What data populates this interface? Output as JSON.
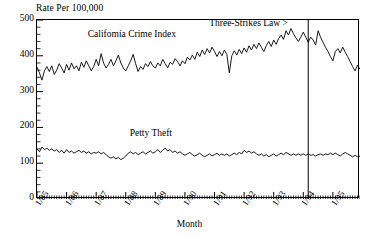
{
  "chart_data": {
    "type": "line",
    "title": "",
    "ylabel": "Rate Per 100,000",
    "xlabel": "Month",
    "ylim": [
      0,
      500
    ],
    "yticks": [
      0,
      100,
      200,
      300,
      400,
      500
    ],
    "ytick_labels": [
      "0",
      "100",
      "200",
      "300",
      "400",
      "500"
    ],
    "xtick_labels": [
      "1/85",
      "1/86",
      "1/87",
      "1/88",
      "1/89",
      "1/90",
      "1/91",
      "1/92",
      "1/93",
      "1/94",
      "1/95"
    ],
    "xlim_months": [
      0,
      131
    ],
    "grid": false,
    "legend": "inline-labels",
    "annotations": [
      {
        "name": "three-strikes-law",
        "text": "Three-Strikes Law >",
        "x_month": 110,
        "y_value": 492
      },
      {
        "name": "vline-three-strikes",
        "type": "vline",
        "x_month": 110,
        "label": "Three-Strikes Law enactment (3/94)"
      }
    ],
    "series": [
      {
        "name": "California Crime Index",
        "label": "Califomia Crime Index",
        "label_x_month": 21,
        "label_y_value": 455,
        "color": "#000000",
        "values": [
          368,
          352,
          332,
          358,
          370,
          356,
          372,
          348,
          360,
          378,
          366,
          352,
          376,
          360,
          380,
          364,
          372,
          358,
          382,
          368,
          386,
          372,
          358,
          370,
          390,
          372,
          406,
          380,
          366,
          376,
          390,
          372,
          386,
          402,
          380,
          366,
          358,
          372,
          386,
          404,
          378,
          356,
          370,
          362,
          378,
          370,
          384,
          372,
          366,
          380,
          372,
          390,
          378,
          366,
          382,
          376,
          392,
          384,
          372,
          386,
          378,
          396,
          388,
          402,
          390,
          410,
          398,
          416,
          404,
          420,
          408,
          424,
          412,
          398,
          412,
          400,
          416,
          404,
          352,
          400,
          414,
          402,
          418,
          406,
          422,
          410,
          428,
          416,
          432,
          420,
          436,
          424,
          412,
          428,
          440,
          426,
          444,
          432,
          448,
          458,
          446,
          470,
          458,
          476,
          462,
          450,
          440,
          452,
          466,
          452,
          438,
          452,
          444,
          430,
          470,
          452,
          438,
          424,
          412,
          398,
          386,
          412,
          420,
          408,
          424,
          410,
          398,
          384,
          370,
          358,
          374,
          362
        ]
      },
      {
        "name": "Petty Theft",
        "label": "Petty Theft",
        "label_x_month": 38,
        "label_y_value": 178,
        "color": "#000000",
        "values": [
          140,
          132,
          145,
          138,
          142,
          136,
          140,
          134,
          138,
          130,
          136,
          128,
          138,
          130,
          134,
          128,
          132,
          136,
          130,
          134,
          128,
          132,
          126,
          130,
          128,
          132,
          126,
          130,
          124,
          118,
          114,
          118,
          112,
          116,
          110,
          114,
          120,
          128,
          132,
          126,
          130,
          124,
          128,
          132,
          126,
          130,
          134,
          128,
          132,
          138,
          130,
          136,
          142,
          134,
          138,
          130,
          134,
          128,
          132,
          126,
          122,
          126,
          130,
          124,
          120,
          124,
          128,
          122,
          118,
          122,
          126,
          120,
          124,
          128,
          122,
          126,
          122,
          126,
          120,
          124,
          128,
          124,
          130,
          126,
          136,
          130,
          134,
          128,
          132,
          126,
          122,
          126,
          120,
          124,
          118,
          122,
          126,
          120,
          124,
          128,
          124,
          130,
          126,
          122,
          126,
          122,
          126,
          122,
          126,
          122,
          126,
          122,
          124,
          120,
          124,
          126,
          122,
          126,
          124,
          128,
          124,
          128,
          124,
          120,
          126,
          130,
          126,
          122,
          118,
          122,
          118,
          120
        ]
      }
    ]
  }
}
